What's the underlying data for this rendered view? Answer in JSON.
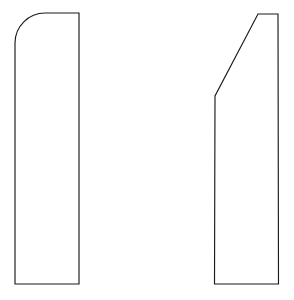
{
  "figure": {
    "background_color": "#ffffff",
    "stroke_color": "#1a1a1a",
    "fill_color": "#ffffff",
    "stroke_width": 1.15,
    "canvas": {
      "width": 294,
      "height": 300
    }
  },
  "shapes": {
    "left": {
      "name": "rounded-top-left-profile",
      "description": "Tall narrow vertical profile with a rounded upper-left corner and square upper-right, lower-left and lower-right corners",
      "bounds": {
        "x": 15,
        "y": 13,
        "width": 64,
        "height": 271
      },
      "corner_radius": 30,
      "path": "M 45 13 L 79 13 L 79 284 L 15 284 L 15 43 A 30 30 0 0 1 45 13 Z",
      "vertices": [
        {
          "label": "top-right",
          "x": 79,
          "y": 13
        },
        {
          "label": "bottom-right",
          "x": 79,
          "y": 284
        },
        {
          "label": "bottom-left",
          "x": 15,
          "y": 284
        },
        {
          "label": "arc-start-left",
          "x": 15,
          "y": 43
        },
        {
          "label": "arc-end-top",
          "x": 45,
          "y": 13
        }
      ]
    },
    "right": {
      "name": "chamfered-top-left-profile",
      "description": "Tall narrow vertical profile with a long diagonal chamfer on the upper-left side",
      "bounds": {
        "x": 215,
        "y": 14,
        "width": 64,
        "height": 270
      },
      "path": "M 258 14 L 278 14 L 278.5 284 L 214.5 284 L 215 96 Z",
      "vertices": [
        {
          "label": "chamfer-top",
          "x": 258,
          "y": 14
        },
        {
          "label": "top-right",
          "x": 278,
          "y": 14
        },
        {
          "label": "bottom-right",
          "x": 278.5,
          "y": 284
        },
        {
          "label": "bottom-left",
          "x": 214.5,
          "y": 284
        },
        {
          "label": "chamfer-bottom",
          "x": 215,
          "y": 96
        }
      ]
    }
  }
}
